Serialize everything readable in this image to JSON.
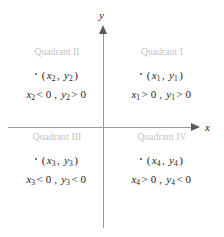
{
  "figure": {
    "type": "cartesian-coordinate-plane",
    "axes": {
      "x_label": "x",
      "y_label": "y",
      "x_arrow_direction": "right",
      "y_arrow_direction": "up",
      "axis_color": "#9a9a9a",
      "origin": {
        "x": 103,
        "y": 127
      }
    },
    "quadrants": [
      {
        "id": "I",
        "title": "Quadrant I",
        "point": "(x₁, y₂)",
        "point_var_x": "x",
        "point_sub_x": "1",
        "point_var_y": "y",
        "point_sub_y": "1",
        "sign_x_operator": ">",
        "sign_x_value": "0",
        "sign_y_operator": ">",
        "sign_y_value": "0",
        "sign_text": "x₁ > 0, y₁ > 0"
      },
      {
        "id": "II",
        "title": "Quadrant II",
        "point_var_x": "x",
        "point_sub_x": "2",
        "point_var_y": "y",
        "point_sub_y": "2",
        "sign_x_operator": "<",
        "sign_x_value": "0",
        "sign_y_operator": ">",
        "sign_y_value": "0",
        "sign_text": "x₂ < 0, y₂ > 0"
      },
      {
        "id": "III",
        "title": "Quadrant III",
        "point_var_x": "x",
        "point_sub_x": "3",
        "point_var_y": "y",
        "point_sub_y": "3",
        "sign_x_operator": "<",
        "sign_x_value": "0",
        "sign_y_operator": "<",
        "sign_y_value": "0",
        "sign_text": "x₃ < 0, y₃ < 0"
      },
      {
        "id": "IV",
        "title": "Quadrant IV",
        "point_var_x": "x",
        "point_sub_x": "4",
        "point_var_y": "y",
        "point_sub_y": "4",
        "sign_x_operator": ">",
        "sign_x_value": "0",
        "sign_y_operator": "<",
        "sign_y_value": "0",
        "sign_text": "x₄ > 0, y₄ < 0"
      }
    ],
    "punctuation": {
      "open_paren": "(",
      "close_paren": ")",
      "comma": ",",
      "sub_comma": ","
    },
    "colors": {
      "quadrant_title": "#c2c2c2",
      "text": "#1a1a1a",
      "axis": "#9a9a9a",
      "arrow": "#5a5a5a",
      "background": "#ffffff"
    }
  }
}
